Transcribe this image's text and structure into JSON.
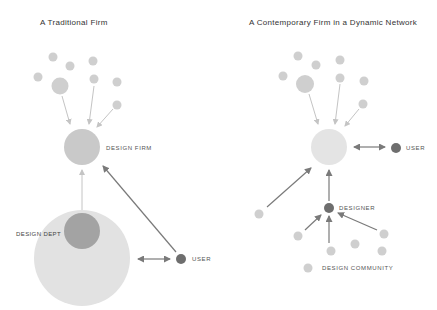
{
  "left_panel": {
    "title": "A Traditional Firm",
    "labels": {
      "design_firm": "DESIGN FIRM",
      "design_dept": "DESIGN DEPT",
      "user": "USER"
    }
  },
  "right_panel": {
    "title": "A Contemporary Firm in a Dynamic Network",
    "labels": {
      "user": "USER",
      "designer": "DESIGNER",
      "design_community": "DESIGN COMMUNITY"
    }
  },
  "colors": {
    "small_node": "#cfcfcf",
    "design_firm_traditional": "#c9c9c9",
    "design_firm_contemporary": "#e4e4e4",
    "organization": "#e2e2e2",
    "design_dept": "#a3a3a3",
    "user": "#6e6e6e",
    "designer": "#6e6e6e",
    "light_arrow": "#c4c4c4",
    "dark_arrow": "#7a7a7a"
  }
}
